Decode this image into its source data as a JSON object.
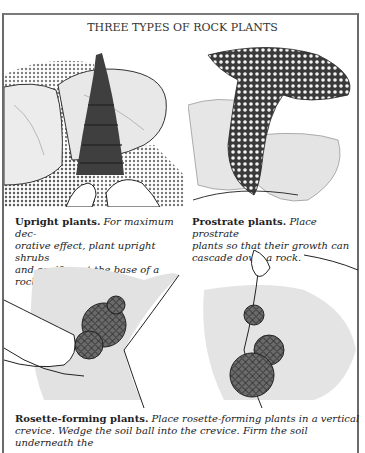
{
  "title": "THREE TYPES OF ROCK PLANTS",
  "panels": [
    {
      "illustration": "upright-conifer-between-rocks",
      "heading": "Upright plants.",
      "body": "For maximum decorative effect, plant upright shrubs and conifers at the base of a rock.",
      "line1_head": "Upright plants.",
      "line1_body": " For maximum dec-",
      "line2": "orative effect, plant upright shrubs",
      "line3": "and conifers at the base of a rock."
    },
    {
      "illustration": "prostrate-plant-cascading-over-rock",
      "heading": "Prostrate plants.",
      "body": "Place prostrate plants so that their growth can cascade down a rock.",
      "line1_head": "Prostrate plants.",
      "line1_body": " Place prostrate",
      "line2": "plants so that their growth can",
      "line3": "cascade down a rock."
    },
    {
      "illustration": "rosette-plants-in-crevice",
      "heading": "Rosette-forming plants.",
      "body": "Place rosette-forming plants in a vertical crevice. Wedge the soil ball into the crevice. Firm the soil underneath the",
      "line1_head": "Rosette-forming plants.",
      "line1_body": " Place rosette-forming plants in a vertical",
      "line2": "crevice. Wedge the soil ball into the crevice. Firm the soil underneath the"
    }
  ],
  "colors": {
    "ink": "#222222",
    "stone": "#d8d8d8",
    "foliage": "#4a4a4a",
    "frame": "#6a6a6a"
  }
}
